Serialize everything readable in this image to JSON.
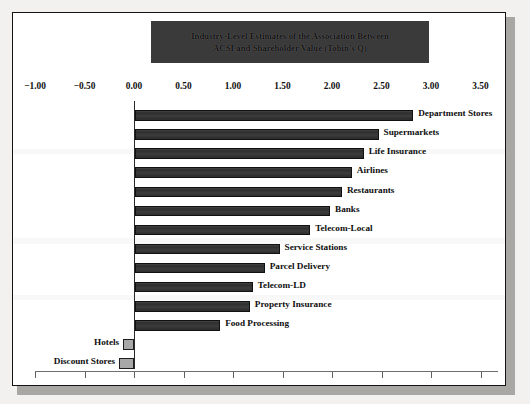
{
  "figure": {
    "title_line1": "Industry-Level Estimates of the Association Between",
    "title_line2": "ACSI and Shareholder Value (Tobin's Q)",
    "title_banner_color": "#3a3a3a",
    "positive_bar_color": "#2e2e2e",
    "negative_bar_color": "#a8a8a8",
    "frame_color": "#141414"
  },
  "chart_data": {
    "type": "bar",
    "orientation": "horizontal",
    "title": "Industry-Level Estimates of the Association Between ACSI and Shareholder Value (Tobin's Q)",
    "xlabel": "",
    "ylabel": "",
    "xlim": [
      -1.0,
      3.5
    ],
    "xticks": [
      -1.0,
      -0.5,
      0.0,
      0.5,
      1.0,
      1.5,
      2.0,
      2.5,
      3.0,
      3.5
    ],
    "xtick_labels": [
      "−1.00",
      "−0.50",
      "0.00",
      "0.50",
      "1.00",
      "1.50",
      "2.00",
      "2.50",
      "3.00",
      "3.50"
    ],
    "grid": false,
    "legend": "none",
    "categories": [
      "Department Stores",
      "Supermarkets",
      "Life Insurance",
      "Airlines",
      "Restaurants",
      "Banks",
      "Telecom-Local",
      "Service Stations",
      "Parcel Delivery",
      "Telecom-LD",
      "Property Insurance",
      "Food Processing",
      "Hotels",
      "Discount Stores"
    ],
    "values": [
      2.81,
      2.46,
      2.31,
      2.19,
      2.09,
      1.97,
      1.77,
      1.46,
      1.31,
      1.19,
      1.16,
      0.86,
      -0.11,
      -0.15
    ]
  }
}
